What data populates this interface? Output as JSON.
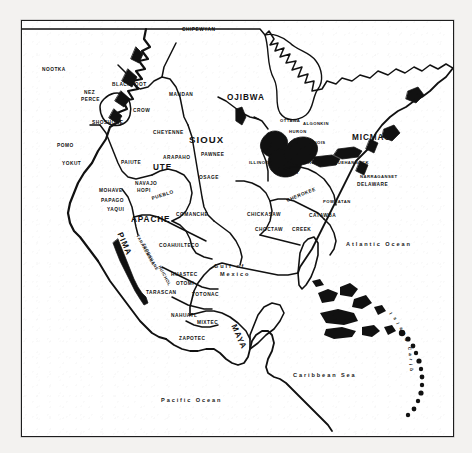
{
  "map": {
    "title": "Native peoples of North America",
    "frame": {
      "x": 21,
      "y": 20,
      "width": 431,
      "height": 415,
      "border_color": "#1d1d1d"
    },
    "background_color": "#ffffff",
    "ink_color": "#111111",
    "water_labels": [
      {
        "name": "atlantic-ocean",
        "lines": [
          "Atlantic Ocean"
        ],
        "x": 345,
        "y": 239
      },
      {
        "name": "caribbean-sea",
        "lines": [
          "Caribbean Sea"
        ],
        "x": 292,
        "y": 370
      },
      {
        "name": "pacific-ocean",
        "lines": [
          "Pacific Ocean"
        ],
        "x": 160,
        "y": 395
      },
      {
        "name": "gulf-of-mexico",
        "lines": [
          "Gulf of",
          "Mexico"
        ],
        "x": 213,
        "y": 261
      }
    ],
    "island_carib": {
      "name": "island-carib",
      "text": "Island Carib",
      "letters": [
        {
          "ch": "I",
          "x": 389,
          "y": 310,
          "rot": 58
        },
        {
          "ch": "s",
          "x": 393,
          "y": 315,
          "rot": 62
        },
        {
          "ch": "l",
          "x": 396,
          "y": 320,
          "rot": 66
        },
        {
          "ch": "a",
          "x": 399,
          "y": 325,
          "rot": 70
        },
        {
          "ch": "n",
          "x": 402,
          "y": 330,
          "rot": 74
        },
        {
          "ch": "d",
          "x": 404,
          "y": 336,
          "rot": 78
        },
        {
          "ch": "C",
          "x": 407,
          "y": 345,
          "rot": 84
        },
        {
          "ch": "a",
          "x": 408,
          "y": 351,
          "rot": 88
        },
        {
          "ch": "r",
          "x": 409,
          "y": 356,
          "rot": 92
        },
        {
          "ch": "i",
          "x": 409,
          "y": 361,
          "rot": 95
        },
        {
          "ch": "b",
          "x": 409,
          "y": 366,
          "rot": 99
        }
      ]
    },
    "tribes": [
      {
        "name": "chipewyan",
        "label": "CHIPEWYAN",
        "x": 181,
        "y": 27,
        "size": "t-sm"
      },
      {
        "name": "nootka",
        "label": "NOOTKA",
        "x": 41,
        "y": 67,
        "size": "t-sm"
      },
      {
        "name": "blackfoot",
        "label": "BLACKFOOT",
        "x": 111,
        "y": 82,
        "size": "t-sm"
      },
      {
        "name": "nez-perce",
        "label": "NEZ",
        "x": 83,
        "y": 90,
        "size": "t-sm"
      },
      {
        "name": "nez-perce-2",
        "label": "PERCE",
        "x": 80,
        "y": 97,
        "size": "t-sm"
      },
      {
        "name": "mandan",
        "label": "MANDAN",
        "x": 168,
        "y": 92,
        "size": "t-sm"
      },
      {
        "name": "ojibwa",
        "label": "OJIBWA",
        "x": 226,
        "y": 93,
        "size": "t-lg"
      },
      {
        "name": "crow",
        "label": "CROW",
        "x": 132,
        "y": 108,
        "size": "t-sm"
      },
      {
        "name": "ottawa",
        "label": "OTTAWA",
        "x": 279,
        "y": 118,
        "size": "t-tiny"
      },
      {
        "name": "algonkin",
        "label": "ALGONKIN",
        "x": 302,
        "y": 121,
        "size": "t-tiny"
      },
      {
        "name": "shoshone",
        "label": "SHOSHONE",
        "x": 91,
        "y": 120,
        "size": "t-sm"
      },
      {
        "name": "cheyenne",
        "label": "CHEYENNE",
        "x": 152,
        "y": 130,
        "size": "t-sm"
      },
      {
        "name": "huron",
        "label": "HURON",
        "x": 288,
        "y": 129,
        "size": "t-tiny"
      },
      {
        "name": "sioux",
        "label": "SIOUX",
        "x": 188,
        "y": 134,
        "size": "t-xl"
      },
      {
        "name": "micmac",
        "label": "MICMAC",
        "x": 351,
        "y": 133,
        "size": "t-lg"
      },
      {
        "name": "iroquois",
        "label": "IROQUOIS",
        "x": 300,
        "y": 140,
        "size": "t-tiny"
      },
      {
        "name": "pomo",
        "label": "POMO",
        "x": 56,
        "y": 143,
        "size": "t-sm"
      },
      {
        "name": "fox",
        "label": "FOX",
        "x": 270,
        "y": 147,
        "size": "t-tiny"
      },
      {
        "name": "arapaho",
        "label": "ARAPAHO",
        "x": 162,
        "y": 155,
        "size": "t-sm"
      },
      {
        "name": "pawnee",
        "label": "PAWNEE",
        "x": 200,
        "y": 152,
        "size": "t-sm"
      },
      {
        "name": "illinois",
        "label": "ILLINOIS",
        "x": 248,
        "y": 160,
        "size": "t-tiny"
      },
      {
        "name": "kickapoo",
        "label": "KICKAPOO",
        "x": 268,
        "y": 160,
        "size": "t-sm"
      },
      {
        "name": "erie",
        "label": "ERIE",
        "x": 303,
        "y": 160,
        "size": "t-sm"
      },
      {
        "name": "susquehannock",
        "label": "SUSQUEHANNOCK",
        "x": 323,
        "y": 160,
        "size": "t-tiny"
      },
      {
        "name": "yokut",
        "label": "YOKUT",
        "x": 61,
        "y": 161,
        "size": "t-sm"
      },
      {
        "name": "paiute",
        "label": "PAIUTE",
        "x": 120,
        "y": 160,
        "size": "t-sm"
      },
      {
        "name": "ute",
        "label": "UTE",
        "x": 152,
        "y": 163,
        "size": "t-lg"
      },
      {
        "name": "miami",
        "label": "MIAMI",
        "x": 281,
        "y": 170,
        "size": "t-sm"
      },
      {
        "name": "narraganset",
        "label": "NARRAGANSET",
        "x": 359,
        "y": 174,
        "size": "t-tiny"
      },
      {
        "name": "osage",
        "label": "OSAGE",
        "x": 198,
        "y": 175,
        "size": "t-sm"
      },
      {
        "name": "navajo",
        "label": "NAVAJO",
        "x": 134,
        "y": 181,
        "size": "t-sm"
      },
      {
        "name": "delaware",
        "label": "DELAWARE",
        "x": 356,
        "y": 182,
        "size": "t-sm"
      },
      {
        "name": "mohave",
        "label": "MOHAVE",
        "x": 98,
        "y": 188,
        "size": "t-sm"
      },
      {
        "name": "hopi",
        "label": "HOPI",
        "x": 136,
        "y": 188,
        "size": "t-sm"
      },
      {
        "name": "papago",
        "label": "PAPAGO",
        "x": 100,
        "y": 198,
        "size": "t-sm"
      },
      {
        "name": "pueblo",
        "label": "PUEBLO",
        "x": 151,
        "y": 196,
        "size": "t-sm",
        "rot": -18
      },
      {
        "name": "cherokee",
        "label": "CHEROKEE",
        "x": 286,
        "y": 198,
        "size": "t-sm",
        "rot": -22
      },
      {
        "name": "powhatan",
        "label": "POWHATAN",
        "x": 322,
        "y": 199,
        "size": "t-tiny"
      },
      {
        "name": "yaqui",
        "label": "YAQUI",
        "x": 106,
        "y": 207,
        "size": "t-sm"
      },
      {
        "name": "apache",
        "label": "APACHE",
        "x": 130,
        "y": 215,
        "size": "t-lg"
      },
      {
        "name": "comanche",
        "label": "COMANCHE",
        "x": 175,
        "y": 212,
        "size": "t-sm"
      },
      {
        "name": "chickasaw",
        "label": "CHICKASAW",
        "x": 246,
        "y": 212,
        "size": "t-sm"
      },
      {
        "name": "catawba",
        "label": "CATAWBA",
        "x": 308,
        "y": 213,
        "size": "t-sm"
      },
      {
        "name": "choctaw",
        "label": "CHOCTAW",
        "x": 254,
        "y": 227,
        "size": "t-sm"
      },
      {
        "name": "creek",
        "label": "CREEK",
        "x": 291,
        "y": 227,
        "size": "t-sm"
      },
      {
        "name": "pima",
        "label": "PIMA",
        "x": 118,
        "y": 228,
        "size": "t-lg",
        "rot": 66
      },
      {
        "name": "tarahumara",
        "label": "TARAHUMARA",
        "x": 136,
        "y": 232,
        "size": "t-tiny",
        "rot": 62
      },
      {
        "name": "tepehuane",
        "label": "TEPEHUANE",
        "x": 142,
        "y": 241,
        "size": "t-tiny",
        "rot": 62
      },
      {
        "name": "coahuilteco",
        "label": "COAHUILTECO",
        "x": 158,
        "y": 243,
        "size": "t-sm"
      },
      {
        "name": "huichol",
        "label": "HUICHOL",
        "x": 158,
        "y": 263,
        "size": "t-tiny",
        "rot": 62
      },
      {
        "name": "huastec",
        "label": "HUASTEC",
        "x": 170,
        "y": 272,
        "size": "t-sm"
      },
      {
        "name": "otomi",
        "label": "OTOMI",
        "x": 175,
        "y": 281,
        "size": "t-sm"
      },
      {
        "name": "tarascan",
        "label": "TARASCAN",
        "x": 145,
        "y": 290,
        "size": "t-sm"
      },
      {
        "name": "totonac",
        "label": "TOTONAC",
        "x": 191,
        "y": 292,
        "size": "t-sm"
      },
      {
        "name": "nahuatl",
        "label": "NAHUATL",
        "x": 170,
        "y": 313,
        "size": "t-sm"
      },
      {
        "name": "mixtec",
        "label": "MIXTEC",
        "x": 196,
        "y": 320,
        "size": "t-sm"
      },
      {
        "name": "maya",
        "label": "MAYA",
        "x": 232,
        "y": 320,
        "size": "t-lg",
        "rot": 66
      },
      {
        "name": "zapotec",
        "label": "ZAPOTEC",
        "x": 178,
        "y": 336,
        "size": "t-sm"
      }
    ]
  }
}
